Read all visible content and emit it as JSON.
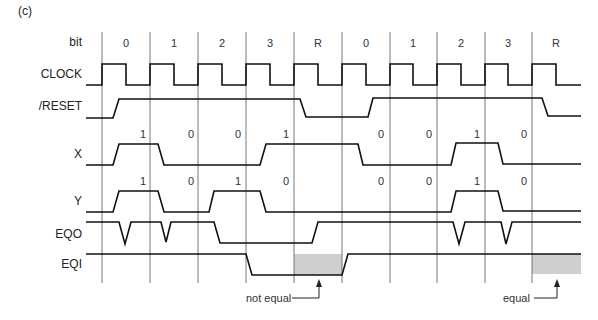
{
  "figure": {
    "panel_label": "(c)",
    "row_labels": {
      "bit": "bit",
      "clock": "CLOCK",
      "reset": "/RESET",
      "x": "X",
      "y": "Y",
      "eqo": "EQO",
      "eqi": "EQI"
    },
    "bit_labels": [
      "0",
      "1",
      "2",
      "3",
      "R",
      "0",
      "1",
      "2",
      "3",
      "R"
    ],
    "x_values": [
      "1",
      "0",
      "0",
      "1",
      "",
      "0",
      "0",
      "1",
      "0",
      ""
    ],
    "y_values": [
      "1",
      "0",
      "1",
      "0",
      "",
      "0",
      "0",
      "1",
      "0",
      ""
    ],
    "annotations": {
      "not_equal": "not equal",
      "equal": "equal"
    },
    "colors": {
      "line": "#111111",
      "grid": "#555555",
      "shade": "#cfcfcf"
    }
  }
}
